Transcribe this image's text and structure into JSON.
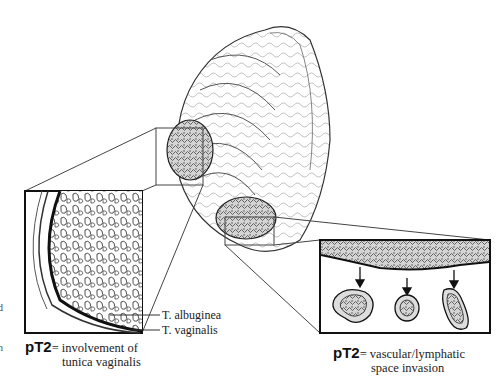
{
  "figure": {
    "type": "medical-illustration",
    "colors": {
      "line": "#222222",
      "background": "#ffffff",
      "tumor_fill": "#bfbfbf"
    }
  },
  "labels": {
    "albuginea": "T. albuginea",
    "vaginalis": "T. vaginalis"
  },
  "captions": {
    "left": {
      "stage": "pT2",
      "line1": "= involvement of",
      "line2": "tunica vaginalis"
    },
    "right": {
      "stage": "pT2",
      "line1": "= vascular/lymphatic",
      "line2": "space invasion"
    }
  },
  "edge_fragments": [
    "d",
    "n"
  ]
}
